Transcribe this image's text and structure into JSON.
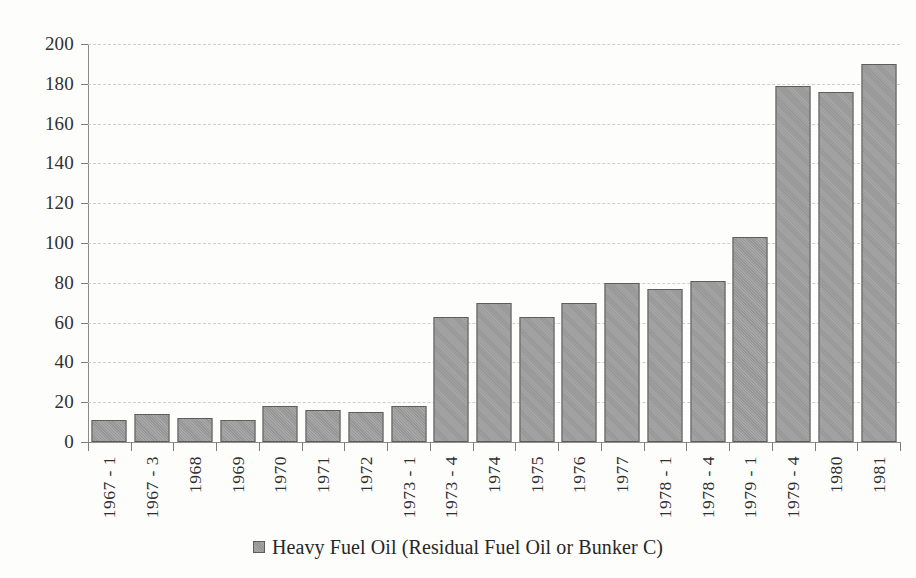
{
  "chart_data": {
    "type": "bar",
    "title": "",
    "xlabel": "",
    "ylabel": "",
    "ylim": [
      0,
      200
    ],
    "ytick_step": 20,
    "yticks": [
      200,
      180,
      160,
      140,
      120,
      100,
      80,
      60,
      40,
      20,
      0
    ],
    "grid": true,
    "legend_position": "bottom",
    "categories": [
      "1967 - 1",
      "1967 - 3",
      "1968",
      "1969",
      "1970",
      "1971",
      "1972",
      "1973 - 1",
      "1973 - 4",
      "1974",
      "1975",
      "1976",
      "1977",
      "1978 - 1",
      "1978 - 4",
      "1979 - 1",
      "1979 - 4",
      "1980",
      "1981"
    ],
    "series": [
      {
        "name": "Heavy Fuel Oil (Residual Fuel Oil or Bunker C)",
        "color": "#9d9d9d",
        "values": [
          11,
          14,
          12,
          11,
          18,
          16,
          15,
          18,
          63,
          70,
          63,
          70,
          80,
          77,
          81,
          103,
          179,
          176,
          190
        ]
      }
    ]
  },
  "legend": {
    "entries": [
      {
        "label": "Heavy Fuel Oil (Residual Fuel Oil or Bunker C)",
        "swatch_color": "#9d9d9d"
      }
    ]
  },
  "colors": {
    "bar_fill": "#9d9d9d",
    "bar_border": "#5d5d5d",
    "grid": "#cfcfcf",
    "axis": "#8a8a8a",
    "text": "#2b2b2b",
    "background": "#fdfdfc"
  }
}
